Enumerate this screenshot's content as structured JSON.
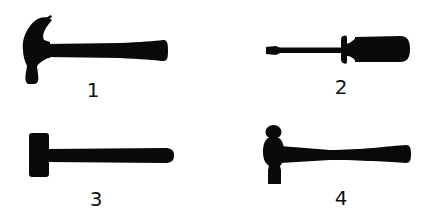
{
  "colors": {
    "silhouette": "#0a0a0a",
    "background": "#ffffff",
    "label": "#111111"
  },
  "tools": [
    {
      "id": 1,
      "icon": "claw-hammer-icon",
      "label": "1"
    },
    {
      "id": 2,
      "icon": "screwdriver-icon",
      "label": "2"
    },
    {
      "id": 3,
      "icon": "sledgehammer-icon",
      "label": "3"
    },
    {
      "id": 4,
      "icon": "ball-peen-hammer-icon",
      "label": "4"
    }
  ]
}
